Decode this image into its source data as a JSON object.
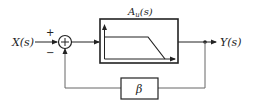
{
  "diagram": {
    "type": "feedback-block-diagram",
    "input_label": "X(s)",
    "output_label": "Y(s)",
    "summer": {
      "plus_sign": "+",
      "minus_sign": "−",
      "inner_symbol": "+"
    },
    "forward_block": {
      "label": "A",
      "subscript": "u",
      "suffix": "(s)",
      "content": "low-pass frequency response sketch"
    },
    "feedback_block": {
      "label": "β"
    },
    "colors": {
      "line": "#222222",
      "feedback_line": "#666666",
      "background": "#ffffff"
    }
  }
}
